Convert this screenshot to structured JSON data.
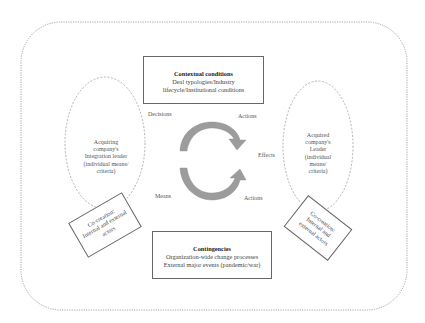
{
  "diagram": {
    "top_box": {
      "title": "Contextual conditions",
      "line1": "Deal typologies/Industry",
      "line2": "lifecycle/Institutional conditions"
    },
    "bottom_box": {
      "title": "Contingencies",
      "line1": "Organization-wide change processes",
      "line2": "External major events (pandemic/war)"
    },
    "left_ellipse": {
      "lines": [
        "Acquiring",
        "company's",
        "Integration leader",
        "(individual means/",
        "criteria)"
      ]
    },
    "right_ellipse": {
      "lines": [
        "Acquired",
        "company's",
        "Leader",
        "(individual",
        "means/",
        "criteria)"
      ]
    },
    "left_rotated_box": {
      "lines": [
        "Co-creation:",
        "Internal and external",
        "actors"
      ]
    },
    "right_rotated_box": {
      "lines": [
        "Co-creation:",
        "Internal and",
        "external actors"
      ]
    },
    "cycle_labels": {
      "top_left": "Decisions",
      "top_right": "Actions",
      "right": "Effects",
      "bottom_left": "Means",
      "bottom_right": "Actions"
    },
    "colors": {
      "outer_border": "#9a9a9a",
      "ellipse_border": "#a0a0a0",
      "box_border": "#666666",
      "arrow_fill": "#9c9c9c",
      "arrow_stroke": "#8a8a8a"
    }
  }
}
